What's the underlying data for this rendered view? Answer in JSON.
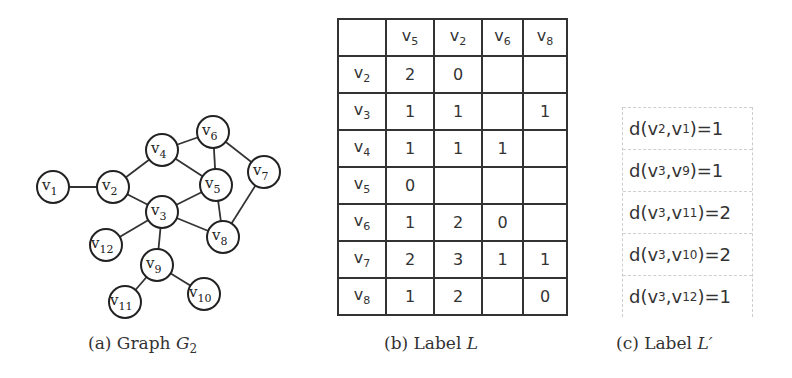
{
  "graph": {
    "name": "G2",
    "node_radius": 16,
    "nodes": [
      {
        "id": "v1",
        "base": "v",
        "sub": "1",
        "x": 53,
        "y": 187
      },
      {
        "id": "v2",
        "base": "v",
        "sub": "2",
        "x": 113,
        "y": 187
      },
      {
        "id": "v3",
        "base": "v",
        "sub": "3",
        "x": 162,
        "y": 212
      },
      {
        "id": "v4",
        "base": "v",
        "sub": "4",
        "x": 162,
        "y": 150
      },
      {
        "id": "v5",
        "base": "v",
        "sub": "5",
        "x": 216,
        "y": 185
      },
      {
        "id": "v6",
        "base": "v",
        "sub": "6",
        "x": 213,
        "y": 132
      },
      {
        "id": "v7",
        "base": "v",
        "sub": "7",
        "x": 264,
        "y": 172
      },
      {
        "id": "v8",
        "base": "v",
        "sub": "8",
        "x": 223,
        "y": 237
      },
      {
        "id": "v9",
        "base": "v",
        "sub": "9",
        "x": 157,
        "y": 265
      },
      {
        "id": "v10",
        "base": "v",
        "sub": "10",
        "x": 204,
        "y": 294
      },
      {
        "id": "v11",
        "base": "v",
        "sub": "11",
        "x": 125,
        "y": 302
      },
      {
        "id": "v12",
        "base": "v",
        "sub": "12",
        "x": 106,
        "y": 245
      }
    ],
    "edges": [
      [
        "v1",
        "v2"
      ],
      [
        "v2",
        "v4"
      ],
      [
        "v2",
        "v3"
      ],
      [
        "v4",
        "v6"
      ],
      [
        "v4",
        "v5"
      ],
      [
        "v6",
        "v5"
      ],
      [
        "v6",
        "v7"
      ],
      [
        "v5",
        "v3"
      ],
      [
        "v5",
        "v8"
      ],
      [
        "v7",
        "v8"
      ],
      [
        "v3",
        "v8"
      ],
      [
        "v3",
        "v12"
      ],
      [
        "v3",
        "v9"
      ],
      [
        "v9",
        "v11"
      ],
      [
        "v9",
        "v10"
      ]
    ]
  },
  "label_table": {
    "columns": [
      "5",
      "2",
      "6",
      "8"
    ],
    "rows": [
      {
        "vertex": "2",
        "values": [
          "2",
          "0",
          "",
          ""
        ]
      },
      {
        "vertex": "3",
        "values": [
          "1",
          "1",
          "",
          "1"
        ]
      },
      {
        "vertex": "4",
        "values": [
          "1",
          "1",
          "1",
          ""
        ]
      },
      {
        "vertex": "5",
        "values": [
          "0",
          "",
          "",
          ""
        ]
      },
      {
        "vertex": "6",
        "values": [
          "1",
          "2",
          "0",
          ""
        ]
      },
      {
        "vertex": "7",
        "values": [
          "2",
          "3",
          "1",
          "1"
        ]
      },
      {
        "vertex": "8",
        "values": [
          "1",
          "2",
          "",
          "0"
        ]
      }
    ]
  },
  "label_prime": [
    {
      "a": "2",
      "b": "1",
      "d": "1"
    },
    {
      "a": "3",
      "b": "9",
      "d": "1"
    },
    {
      "a": "3",
      "b": "11",
      "d": "2"
    },
    {
      "a": "3",
      "b": "10",
      "d": "2"
    },
    {
      "a": "3",
      "b": "12",
      "d": "1"
    }
  ],
  "captions": {
    "a": {
      "prefix": "(a) Graph ",
      "math": "G",
      "sub": "2"
    },
    "b": {
      "prefix": "(b) Label ",
      "math": "L"
    },
    "c": {
      "prefix": "(c) Label ",
      "math": "L′"
    }
  }
}
